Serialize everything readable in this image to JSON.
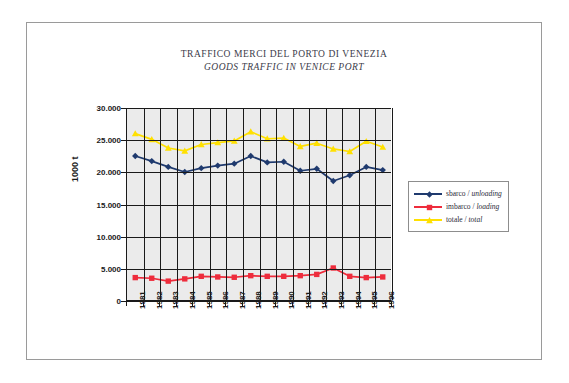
{
  "title": {
    "italian": "TRAFFICO MERCI DEL PORTO DI VENEZIA",
    "english": "GOODS TRAFFIC IN VENICE PORT"
  },
  "colors": {
    "unloading": "#1f3a6e",
    "loading": "#ee2c3c",
    "total": "#ffe000",
    "grid": "#1a1a1a",
    "plot_background": "#ebebeb",
    "frame_border": "#9a9a9a",
    "text": "#3b3b4a"
  },
  "legend": {
    "position": "right",
    "items": [
      {
        "label_it": "sbarco",
        "separator": " / ",
        "label_en": "unloading",
        "color": "#1f3a6e",
        "marker": "diamond"
      },
      {
        "label_it": "imbarco",
        "separator": " / ",
        "label_en": "loading",
        "color": "#ee2c3c",
        "marker": "square"
      },
      {
        "label_it": "totale",
        "separator": " / ",
        "label_en": "total",
        "color": "#ffe000",
        "marker": "triangle"
      }
    ]
  },
  "chart_data": {
    "type": "line",
    "xlabel": "",
    "ylabel": "1000 t",
    "ylim": [
      0,
      30000
    ],
    "ytick_labels": [
      "30.000",
      "25.000",
      "20.000",
      "15.000",
      "10.000",
      "5.000",
      "0"
    ],
    "ytick_values": [
      30000,
      25000,
      20000,
      15000,
      10000,
      5000,
      0
    ],
    "grid": true,
    "legend_position": "right",
    "categories": [
      "1981",
      "1982",
      "1983",
      "1984",
      "1985",
      "1986",
      "1987",
      "1988",
      "1989",
      "1990",
      "1991",
      "1992",
      "1993",
      "1994",
      "1995",
      "1996"
    ],
    "series": [
      {
        "name": "sbarco / unloading",
        "color": "#1f3a6e",
        "marker": "diamond",
        "values": [
          22500,
          21700,
          20800,
          20000,
          20600,
          21000,
          21300,
          22500,
          21500,
          21600,
          20200,
          20500,
          18600,
          19500,
          20800,
          20300
        ]
      },
      {
        "name": "imbarco / loading",
        "color": "#ee2c3c",
        "marker": "square",
        "values": [
          3500,
          3400,
          2950,
          3300,
          3700,
          3600,
          3550,
          3800,
          3700,
          3700,
          3800,
          4000,
          5000,
          3700,
          3500,
          3600
        ]
      },
      {
        "name": "totale / total",
        "color": "#ffe000",
        "marker": "triangle",
        "values": [
          26000,
          25100,
          23750,
          23300,
          24300,
          24600,
          24850,
          26300,
          25200,
          25300,
          24000,
          24500,
          23600,
          23200,
          24800,
          23900
        ]
      }
    ]
  }
}
